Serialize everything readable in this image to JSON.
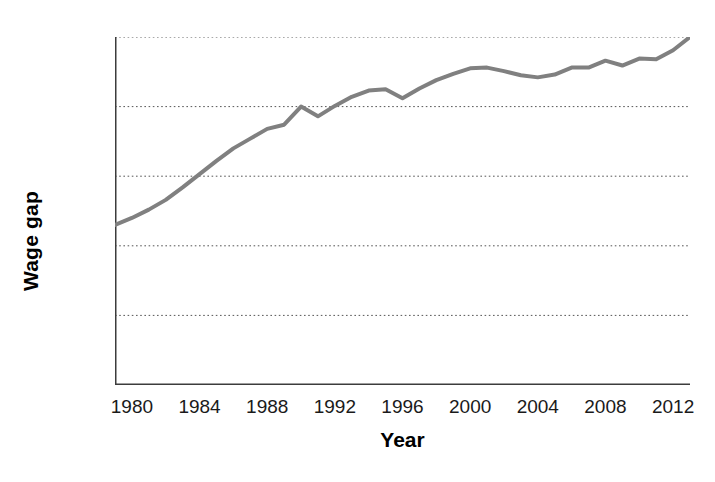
{
  "chart_data": {
    "type": "line",
    "title": "",
    "xlabel": "Year",
    "ylabel": "Wage gap",
    "xlim": [
      1979,
      2013
    ],
    "ylim": [
      0,
      50
    ],
    "grid": true,
    "grid_axis": "y",
    "legend": "none",
    "line_color": "#808080",
    "line_width": 4,
    "y_tick_labels": [
      "50%",
      "40%",
      "30%",
      "20%",
      "10%",
      "0"
    ],
    "y_tick_values": [
      50,
      40,
      30,
      20,
      10,
      0
    ],
    "x_tick_labels": [
      "1980",
      "1984",
      "1988",
      "1992",
      "1996",
      "2000",
      "2004",
      "2008",
      "2012"
    ],
    "x_tick_values": [
      1980,
      1984,
      1988,
      1992,
      1996,
      2000,
      2004,
      2008,
      2012
    ],
    "x_minor_ticks": [
      1979,
      1980,
      1981,
      1982,
      1983,
      1984,
      1985,
      1986,
      1987,
      1988,
      1989,
      1990,
      1991,
      1992,
      1993,
      1994,
      1995,
      1996,
      1997,
      1998,
      1999,
      2000,
      2001,
      2002,
      2003,
      2004,
      2005,
      2006,
      2007,
      2008,
      2009,
      2010,
      2011,
      2012,
      2013
    ],
    "series": [
      {
        "name": "Wage gap",
        "x": [
          1979,
          1980,
          1981,
          1982,
          1983,
          1984,
          1985,
          1986,
          1987,
          1988,
          1989,
          1990,
          1991,
          1992,
          1993,
          1994,
          1995,
          1996,
          1997,
          1998,
          1999,
          2000,
          2001,
          2002,
          2003,
          2004,
          2005,
          2006,
          2007,
          2008,
          2009,
          2010,
          2011,
          2012,
          2013
        ],
        "values": [
          23.0,
          24.0,
          25.2,
          26.6,
          28.4,
          30.3,
          32.2,
          34.0,
          35.4,
          36.8,
          37.4,
          40.0,
          38.6,
          40.1,
          41.4,
          42.3,
          42.5,
          41.2,
          42.6,
          43.8,
          44.7,
          45.5,
          45.6,
          45.1,
          44.5,
          44.2,
          44.6,
          45.6,
          45.6,
          46.6,
          45.9,
          46.9,
          46.8,
          48.1,
          50.0
        ]
      }
    ]
  },
  "axes": {
    "ylabel_text": "Wage gap",
    "xlabel_text": "Year"
  }
}
